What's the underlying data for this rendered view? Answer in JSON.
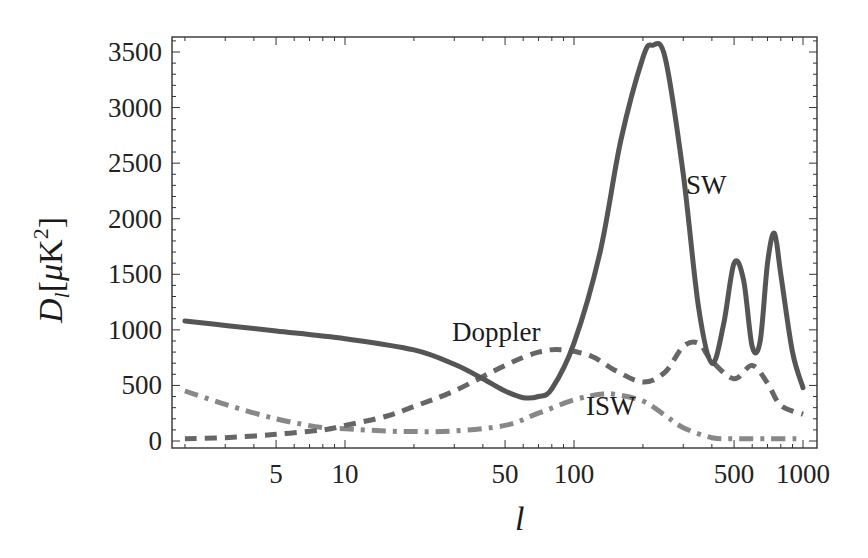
{
  "chart_data": {
    "type": "line",
    "title": "",
    "xlabel": "l",
    "ylabel": "D_l [μK^2]",
    "xscale": "log",
    "xlim": [
      1.76,
      1150
    ],
    "ylim": [
      0,
      3600
    ],
    "x_ticks": [
      5,
      10,
      50,
      100,
      500,
      1000
    ],
    "x_tick_labels": [
      "5",
      "10",
      "50",
      "100",
      "500",
      "1000"
    ],
    "y_ticks": [
      0,
      500,
      1000,
      1500,
      2000,
      2500,
      3000,
      3500
    ],
    "y_tick_labels": [
      "0",
      "500",
      "1000",
      "1500",
      "2000",
      "2500",
      "3000",
      "3500"
    ],
    "grid": false,
    "legend": "none (inline annotations)",
    "annotations": [
      {
        "text": "SW",
        "x": 330,
        "y": 2250
      },
      {
        "text": "Doppler",
        "x": 40,
        "y": 950
      },
      {
        "text": "ISW",
        "x": 160,
        "y": 120
      }
    ],
    "series": [
      {
        "name": "SW",
        "style": "solid",
        "color": "#555555",
        "x": [
          2,
          3,
          5,
          10,
          20,
          30,
          40,
          50,
          60,
          70,
          80,
          100,
          130,
          160,
          200,
          220,
          250,
          300,
          350,
          400,
          450,
          500,
          550,
          600,
          650,
          700,
          750,
          800,
          900,
          1000
        ],
        "y": [
          1080,
          1040,
          990,
          920,
          820,
          690,
          560,
          450,
          390,
          400,
          470,
          880,
          1700,
          2700,
          3450,
          3560,
          3450,
          2400,
          1200,
          700,
          1050,
          1600,
          1450,
          850,
          900,
          1600,
          1870,
          1500,
          800,
          480
        ]
      },
      {
        "name": "Doppler",
        "style": "dashed",
        "color": "#666666",
        "x": [
          2,
          3,
          5,
          8,
          10,
          15,
          20,
          30,
          50,
          70,
          90,
          120,
          150,
          200,
          250,
          300,
          350,
          400,
          500,
          600,
          700,
          800,
          1000
        ],
        "y": [
          20,
          30,
          60,
          100,
          140,
          220,
          310,
          450,
          680,
          800,
          820,
          760,
          640,
          530,
          620,
          850,
          880,
          720,
          560,
          680,
          520,
          320,
          240
        ]
      },
      {
        "name": "ISW",
        "style": "dash-dot",
        "color": "#888888",
        "x": [
          2,
          3,
          5,
          8,
          10,
          15,
          20,
          30,
          50,
          70,
          100,
          130,
          150,
          200,
          250,
          300,
          400,
          500,
          700,
          1000
        ],
        "y": [
          450,
          330,
          200,
          120,
          110,
          90,
          85,
          90,
          140,
          250,
          370,
          420,
          420,
          360,
          230,
          120,
          30,
          20,
          20,
          20
        ]
      }
    ]
  },
  "labels": {
    "ylabel_main": "D",
    "ylabel_sub": "l",
    "ylabel_units_open": "[",
    "ylabel_mu": "μ",
    "ylabel_K": "K",
    "ylabel_sup": "2",
    "ylabel_units_close": "]",
    "xlabel": "l",
    "anno_sw": "SW",
    "anno_doppler": "Doppler",
    "anno_isw": "ISW"
  }
}
